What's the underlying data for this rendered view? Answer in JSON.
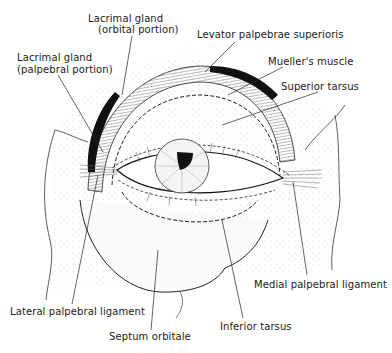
{
  "figure": {
    "labels": {
      "lacrimal_orbital_line1": "Lacrimal gland",
      "lacrimal_orbital_line2": "(orbital portion)",
      "lacrimal_palpebral_line1": "Lacrimal gland",
      "lacrimal_palpebral_line2": "(palpebral portion)",
      "levator": "Levator palpebrae superioris",
      "mueller": "Mueller's muscle",
      "superior_tarsus": "Superior tarsus",
      "medial_ligament": "Medial palpebral ligament",
      "lateral_ligament": "Lateral palpebral ligament",
      "septum": "Septum orbitale",
      "inferior_tarsus": "Inferior tarsus"
    },
    "colors": {
      "ink": "#1a1a1a",
      "stipple": "#bdbdbd",
      "background": "#ffffff"
    }
  }
}
